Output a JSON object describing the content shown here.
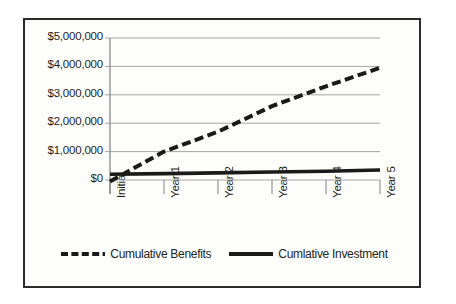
{
  "chart_data": {
    "type": "line",
    "title": "",
    "xlabel": "",
    "ylabel": "",
    "categories": [
      "Initial",
      "Year 1",
      "Year 2",
      "Year 3",
      "Year 4",
      "Year 5"
    ],
    "ylim": [
      0,
      5000000
    ],
    "ytick_values": [
      0,
      1000000,
      2000000,
      3000000,
      4000000,
      5000000
    ],
    "ytick_labels": [
      "$0",
      "$1,000,000",
      "$2,000,000",
      "$3,000,000",
      "$4,000,000",
      "$5,000,000"
    ],
    "grid": "horizontal",
    "legend_position": "bottom-center",
    "series": [
      {
        "name": "Cumulative Benefits",
        "style": "dashed",
        "color": "#1a1a1a",
        "values": [
          -50000,
          1000000,
          1700000,
          2600000,
          3300000,
          3950000
        ]
      },
      {
        "name": "Cumlative Investment",
        "style": "solid",
        "color": "#1a1a1a",
        "values": [
          200000,
          225000,
          250000,
          280000,
          310000,
          350000
        ]
      }
    ]
  },
  "legend": {
    "entries": [
      {
        "label": "Cumulative Benefits"
      },
      {
        "label": "Cumlative Investment"
      }
    ]
  },
  "colors": {
    "frame": "#2b2b2b",
    "gridline": "#a6a6a6",
    "axis": "#808080",
    "text": "#231f20",
    "series": "#1a1a1a",
    "background": "#ffffff"
  }
}
